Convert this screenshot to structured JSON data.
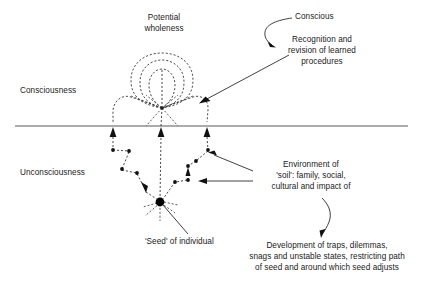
{
  "diagram": {
    "title_concept": "Seed model of consciousness and unconsciousness",
    "labels": {
      "potential_wholeness": "Potential\nwholeness",
      "conscious": "Conscious",
      "recognition": "Recognition and\nrevision of learned\nprocedures",
      "consciousness": "Consciousness",
      "unconsciousness": "Unconsciousness",
      "environment": "Environment of\n'soil': family, social,\ncultural and impact of",
      "seed": "'Seed' of individual",
      "development": "Development of traps, dilemmas,\nsnags and unstable states, restricting path\nof seed and around which seed adjusts"
    },
    "colors": {
      "ink": "#1a1a1a",
      "dashed_stroke": "#2b2b2b",
      "surface_line": "#5a5a5a",
      "node_fill": "#111111",
      "background": "#ffffff"
    },
    "structure": {
      "surface_line_y": 126,
      "convergence_node": {
        "x": 162,
        "y": 108
      },
      "seed_node": {
        "x": 160,
        "y": 202
      },
      "surface_arrow_x_positions": [
        113,
        161,
        207
      ],
      "ring_count": 3
    }
  }
}
